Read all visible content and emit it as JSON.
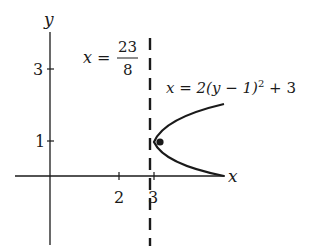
{
  "figure": {
    "axes": {
      "x_label": "x",
      "y_label": "y",
      "x_ticks": [
        "2",
        "3"
      ],
      "y_ticks": [
        "3",
        "1"
      ]
    },
    "asymptote_label": {
      "lhs": "x =",
      "numerator": "23",
      "denominator": "8"
    },
    "curve_label": {
      "text": "x = 2(y − 1)",
      "exponent": "2",
      "suffix": " + 3"
    },
    "colors": {
      "ink": "#1a1a1a",
      "background": "#ffffff"
    }
  }
}
